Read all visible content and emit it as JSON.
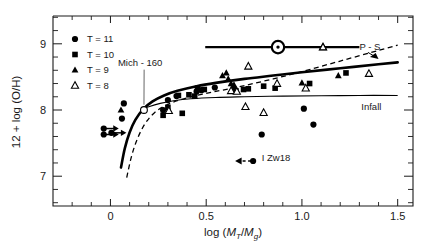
{
  "chart_data": {
    "type": "scatter",
    "title": "",
    "xlabel": "log (M_T/M_g)",
    "xlabel_parts": {
      "prefix": "log (",
      "num": "M",
      "num_sub": "T",
      "slash": "/",
      "den": "M",
      "den_sub": "g",
      "suffix": ")"
    },
    "ylabel": "12 + log (O/H)",
    "xlim": [
      -0.3,
      1.58
    ],
    "ylim": [
      6.55,
      9.42
    ],
    "xticks": [
      0,
      0.5,
      1.0,
      1.5
    ],
    "xtick_labels": [
      "0",
      "0.5",
      "1.0",
      "1.5"
    ],
    "yticks": [
      7,
      8,
      9
    ],
    "ytick_labels": [
      "7",
      "8",
      "9"
    ],
    "x_minor_step": 0.1,
    "y_minor_step": 0.2,
    "grid": false,
    "legend_position": "upper-left",
    "legend": [
      {
        "label": "T = 11",
        "marker": "filled-circle"
      },
      {
        "label": "T = 10",
        "marker": "filled-square"
      },
      {
        "label": "T = 9",
        "marker": "filled-triangle"
      },
      {
        "label": "T = 8",
        "marker": "open-triangle"
      }
    ],
    "series": [
      {
        "name": "T = 11",
        "marker": "filled-circle",
        "points": [
          {
            "x": 0.07,
            "y": 8.1
          },
          {
            "x": 0.06,
            "y": 7.87
          },
          {
            "x": 0.275,
            "y": 8.0
          },
          {
            "x": 0.3,
            "y": 8.15
          },
          {
            "x": 0.345,
            "y": 8.21
          },
          {
            "x": 0.45,
            "y": 8.28
          },
          {
            "x": 0.475,
            "y": 8.3
          },
          {
            "x": 0.545,
            "y": 8.34
          },
          {
            "x": 0.645,
            "y": 8.32
          },
          {
            "x": 0.79,
            "y": 7.63
          },
          {
            "x": 1.01,
            "y": 8.02
          },
          {
            "x": 1.06,
            "y": 7.78
          }
        ]
      },
      {
        "name": "T = 11 lower limits",
        "marker": "filled-circle-arrow-right",
        "points": [
          {
            "x": -0.035,
            "y": 7.72
          },
          {
            "x": -0.035,
            "y": 7.63
          },
          {
            "x": 0.005,
            "y": 7.655
          }
        ]
      },
      {
        "name": "T = 10",
        "marker": "filled-square",
        "points": [
          {
            "x": 0.275,
            "y": 7.92
          },
          {
            "x": 0.3,
            "y": 8.04
          },
          {
            "x": 0.355,
            "y": 8.22
          },
          {
            "x": 0.375,
            "y": 7.95
          },
          {
            "x": 0.41,
            "y": 8.23
          },
          {
            "x": 0.44,
            "y": 8.21
          },
          {
            "x": 0.455,
            "y": 8.33
          },
          {
            "x": 0.49,
            "y": 8.31
          },
          {
            "x": 0.655,
            "y": 8.29
          },
          {
            "x": 0.695,
            "y": 8.31
          },
          {
            "x": 0.72,
            "y": 8.32
          },
          {
            "x": 0.8,
            "y": 8.36
          },
          {
            "x": 0.86,
            "y": 8.33
          },
          {
            "x": 1.04,
            "y": 8.4
          },
          {
            "x": 1.23,
            "y": 8.56
          }
        ]
      },
      {
        "name": "T = 9",
        "marker": "filled-triangle",
        "points": [
          {
            "x": 0.055,
            "y": 8.0
          },
          {
            "x": 0.585,
            "y": 8.52
          },
          {
            "x": 0.605,
            "y": 8.56
          },
          {
            "x": 0.615,
            "y": 8.47
          },
          {
            "x": 0.63,
            "y": 8.4
          },
          {
            "x": 0.645,
            "y": 8.38
          },
          {
            "x": 1.0,
            "y": 8.41
          },
          {
            "x": 1.19,
            "y": 8.52
          }
        ]
      },
      {
        "name": "T = 8",
        "marker": "open-triangle",
        "points": [
          {
            "x": 0.305,
            "y": 7.99
          },
          {
            "x": 0.63,
            "y": 8.29
          },
          {
            "x": 0.66,
            "y": 8.28
          },
          {
            "x": 0.705,
            "y": 8.05
          },
          {
            "x": 0.72,
            "y": 8.66
          },
          {
            "x": 0.8,
            "y": 7.96
          },
          {
            "x": 0.87,
            "y": 8.4
          },
          {
            "x": 1.02,
            "y": 8.33
          },
          {
            "x": 1.11,
            "y": 8.95
          },
          {
            "x": 1.35,
            "y": 8.55
          }
        ]
      },
      {
        "name": "Mich-160",
        "marker": "open-circle",
        "points": [
          {
            "x": 0.175,
            "y": 8.0
          }
        ]
      },
      {
        "name": "Sun",
        "marker": "sun-symbol",
        "points": [
          {
            "x": 0.875,
            "y": 8.95
          }
        ],
        "xerr_low": 0.875,
        "xerr_high": 1.3,
        "xerr_start": 0.495
      },
      {
        "name": "I Zw18",
        "marker": "filled-circle-dashed-arrow-left",
        "points": [
          {
            "x": 0.745,
            "y": 7.23
          }
        ]
      }
    ],
    "curves": [
      {
        "name": "closed-box-model",
        "style": "thick-solid",
        "points": [
          [
            0.055,
            7.13
          ],
          [
            0.075,
            7.42
          ],
          [
            0.1,
            7.66
          ],
          [
            0.13,
            7.85
          ],
          [
            0.17,
            8.01
          ],
          [
            0.22,
            8.13
          ],
          [
            0.28,
            8.22
          ],
          [
            0.35,
            8.29
          ],
          [
            0.45,
            8.36
          ],
          [
            0.55,
            8.41
          ],
          [
            0.7,
            8.47
          ],
          [
            0.85,
            8.52
          ],
          [
            1.0,
            8.57
          ],
          [
            1.2,
            8.63
          ],
          [
            1.4,
            8.69
          ],
          [
            1.5,
            8.72
          ]
        ]
      },
      {
        "name": "P-S-model",
        "style": "dashed",
        "points": [
          [
            0.085,
            6.98
          ],
          [
            0.11,
            7.3
          ],
          [
            0.14,
            7.56
          ],
          [
            0.18,
            7.79
          ],
          [
            0.23,
            7.96
          ],
          [
            0.29,
            8.07
          ],
          [
            0.36,
            8.15
          ],
          [
            0.45,
            8.22
          ],
          [
            0.55,
            8.28
          ],
          [
            0.7,
            8.37
          ],
          [
            0.85,
            8.47
          ],
          [
            1.0,
            8.58
          ],
          [
            1.2,
            8.74
          ],
          [
            1.4,
            8.9
          ],
          [
            1.5,
            8.98
          ]
        ]
      },
      {
        "name": "infall-model",
        "style": "thin-solid",
        "points": [
          [
            0.155,
            8.0
          ],
          [
            0.2,
            8.05
          ],
          [
            0.26,
            8.1
          ],
          [
            0.33,
            8.14
          ],
          [
            0.42,
            8.17
          ],
          [
            0.55,
            8.19
          ],
          [
            0.7,
            8.2
          ],
          [
            0.9,
            8.21
          ],
          [
            1.1,
            8.215
          ],
          [
            1.3,
            8.22
          ],
          [
            1.5,
            8.22
          ]
        ]
      }
    ],
    "annotations": [
      {
        "name": "mich-160",
        "text": "Mich - 160",
        "x": 0.155,
        "y": 8.67,
        "leader_to": {
          "x": 0.175,
          "y": 8.02
        }
      },
      {
        "name": "p-s",
        "text": "P - S",
        "x": 1.3,
        "y": 8.9
      },
      {
        "name": "infall",
        "text": "Infall",
        "x": 1.31,
        "y": 8.0
      },
      {
        "name": "i-zw18",
        "text": "I Zw18",
        "x": 0.79,
        "y": 7.23
      }
    ]
  }
}
